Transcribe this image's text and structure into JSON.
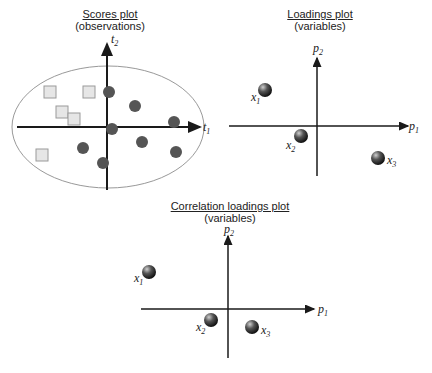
{
  "panels": {
    "scores": {
      "title": "Scores plot",
      "subtitle": "(observations)",
      "x_axis": {
        "symbol": "t",
        "sub": "1"
      },
      "y_axis": {
        "symbol": "t",
        "sub": "2"
      },
      "ellipse": {
        "cx": 108,
        "cy": 127,
        "rx": 96,
        "ry": 61
      },
      "squares": [
        [
          50,
          92
        ],
        [
          89,
          92
        ],
        [
          62,
          112
        ],
        [
          74,
          119
        ],
        [
          42,
          155
        ]
      ],
      "circles": [
        [
          109,
          92
        ],
        [
          112,
          129
        ],
        [
          83,
          148
        ],
        [
          103,
          163
        ],
        [
          135,
          106
        ],
        [
          174,
          122
        ],
        [
          142,
          142
        ],
        [
          176,
          152
        ]
      ]
    },
    "loadings": {
      "title": "Loadings plot",
      "subtitle": "(variables)",
      "x_axis": {
        "symbol": "p",
        "sub": "1"
      },
      "y_axis": {
        "symbol": "p",
        "sub": "2"
      },
      "points": [
        {
          "label": "x",
          "sub": "1",
          "x": 265,
          "y": 90
        },
        {
          "label": "x",
          "sub": "2",
          "x": 301,
          "y": 136
        },
        {
          "label": "x",
          "sub": "3",
          "x": 378,
          "y": 158
        }
      ]
    },
    "correlation": {
      "title": "Correlation loadings plot",
      "subtitle": "(variables)",
      "x_axis": {
        "symbol": "p",
        "sub": "1"
      },
      "y_axis": {
        "symbol": "p",
        "sub": "2"
      },
      "points": [
        {
          "label": "x",
          "sub": "1",
          "x": 149,
          "y": 272
        },
        {
          "label": "x",
          "sub": "2",
          "x": 211,
          "y": 320
        },
        {
          "label": "x",
          "sub": "3",
          "x": 252,
          "y": 327
        }
      ]
    }
  },
  "colors": {
    "axis": "#1a1a1a",
    "ellipse": "#999999",
    "ball": "#555555",
    "square_fill": "#e6e6e6",
    "square_stroke": "#9a9a9a"
  }
}
